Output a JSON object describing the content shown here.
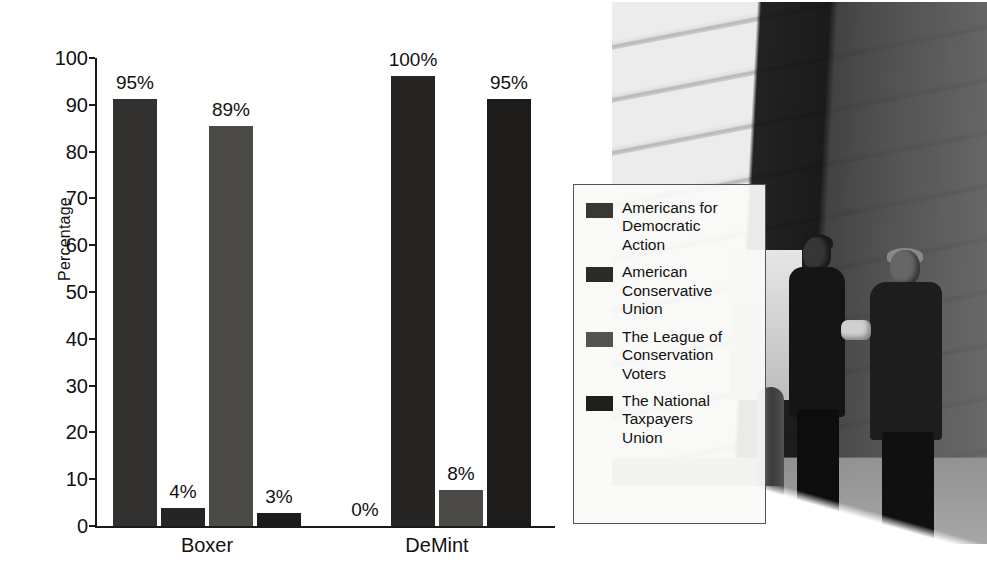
{
  "chart_data": {
    "type": "bar",
    "title": "",
    "subtitle": "",
    "xlabel": "",
    "ylabel": "Percentage",
    "ylim": [
      0,
      100
    ],
    "yticks": [
      0,
      10,
      20,
      30,
      40,
      50,
      60,
      70,
      80,
      90,
      100
    ],
    "grid": false,
    "legend_position": "right",
    "categories": [
      "Boxer",
      "DeMint"
    ],
    "series": [
      {
        "name": "Americans for Democratic Action",
        "values": [
          95,
          0
        ],
        "labels": [
          "95%",
          "0%"
        ],
        "color": "#33312f"
      },
      {
        "name": "American Conservative Union",
        "values": [
          4,
          100
        ],
        "labels": [
          "4%",
          "100%"
        ],
        "color": "#262523"
      },
      {
        "name": "The League of Conservation Voters",
        "values": [
          89,
          8
        ],
        "labels": [
          "89%",
          "8%"
        ],
        "color": "#4c4a47"
      },
      {
        "name": "The National Taxpayers Union",
        "values": [
          3,
          95
        ],
        "labels": [
          "3%",
          "95%"
        ],
        "color": "#1d1c1b"
      }
    ]
  },
  "axis": {
    "y_title": "Percentage",
    "ticks": [
      "100",
      "90",
      "80",
      "70",
      "60",
      "50",
      "40",
      "30",
      "20",
      "10",
      "0"
    ]
  },
  "bars": [
    {
      "group": "Boxer",
      "series": "Americans for Democratic Action",
      "value": 95,
      "label": "95%",
      "color": "#33312f",
      "x": 18,
      "w": 44,
      "show_bar": true
    },
    {
      "group": "Boxer",
      "series": "American Conservative Union",
      "value": 4,
      "label": "4%",
      "color": "#262523",
      "x": 66,
      "w": 44,
      "show_bar": true
    },
    {
      "group": "Boxer",
      "series": "The League of Conservation Voters",
      "value": 89,
      "label": "89%",
      "color": "#4c4a47",
      "x": 114,
      "w": 44,
      "show_bar": true
    },
    {
      "group": "Boxer",
      "series": "The National Taxpayers Union",
      "value": 3,
      "label": "3%",
      "color": "#1d1c1b",
      "x": 162,
      "w": 44,
      "show_bar": true
    },
    {
      "group": "DeMint",
      "series": "Americans for Democratic Action",
      "value": 0,
      "label": "0%",
      "color": "#33312f",
      "x": 248,
      "w": 44,
      "show_bar": false
    },
    {
      "group": "DeMint",
      "series": "American Conservative Union",
      "value": 100,
      "label": "100%",
      "color": "#262523",
      "x": 296,
      "w": 44,
      "show_bar": true
    },
    {
      "group": "DeMint",
      "series": "The League of Conservation Voters",
      "value": 8,
      "label": "8%",
      "color": "#4c4a47",
      "x": 344,
      "w": 44,
      "show_bar": true
    },
    {
      "group": "DeMint",
      "series": "The National Taxpayers Union",
      "value": 95,
      "label": "95%",
      "color": "#1d1c1b",
      "x": 392,
      "w": 44,
      "show_bar": true
    }
  ],
  "group_labels": [
    {
      "text": "Boxer",
      "center": 112
    },
    {
      "text": "DeMint",
      "center": 342
    }
  ],
  "legend": {
    "items": [
      {
        "label": "Americans for\nDemocratic\nAction",
        "color": "#3a3835"
      },
      {
        "label": "American\nConservative\nUnion",
        "color": "#2b2a28"
      },
      {
        "label": "The League of\nConservation\nVoters",
        "color": "#55534f"
      },
      {
        "label": "The National\nTaxpayers\nUnion",
        "color": "#1f1e1d"
      }
    ]
  },
  "photo": {
    "description": "Black and white photograph of two men in dark suits shaking hands outside a stone building"
  }
}
